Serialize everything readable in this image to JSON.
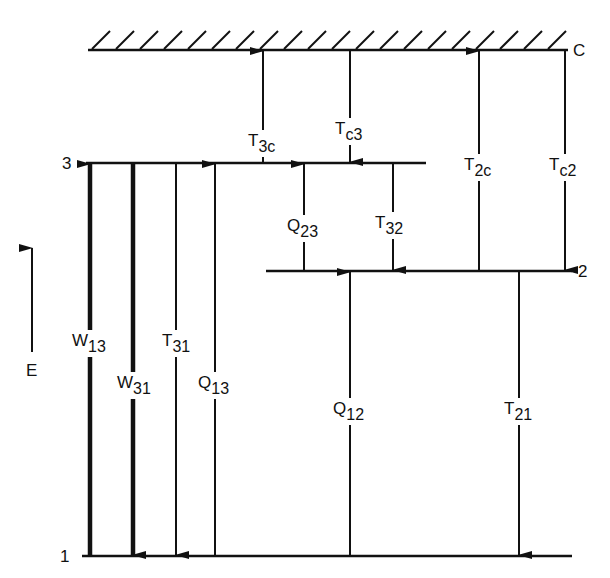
{
  "diagram": {
    "type": "energy-level-diagram",
    "axis": {
      "label": "E",
      "direction": "up"
    },
    "levels": [
      {
        "id": "C",
        "label": "C",
        "note": "continuum (hatched)"
      },
      {
        "id": "3",
        "label": "3"
      },
      {
        "id": "2",
        "label": "2"
      },
      {
        "id": "1",
        "label": "1"
      }
    ],
    "transitions": [
      {
        "name": "W",
        "sub": "13",
        "from": "1",
        "to": "3",
        "direction": "up",
        "weight": "thick"
      },
      {
        "name": "W",
        "sub": "31",
        "from": "3",
        "to": "1",
        "direction": "down",
        "weight": "thick"
      },
      {
        "name": "T",
        "sub": "31",
        "from": "3",
        "to": "1",
        "direction": "down",
        "weight": "thin"
      },
      {
        "name": "Q",
        "sub": "13",
        "from": "1",
        "to": "3",
        "direction": "up",
        "weight": "thin"
      },
      {
        "name": "T",
        "sub": "3c",
        "from": "3",
        "to": "C",
        "direction": "up",
        "weight": "thin"
      },
      {
        "name": "T",
        "sub": "c3",
        "from": "C",
        "to": "3",
        "direction": "down",
        "weight": "thin"
      },
      {
        "name": "Q",
        "sub": "23",
        "from": "2",
        "to": "3",
        "direction": "up",
        "weight": "thin"
      },
      {
        "name": "T",
        "sub": "32",
        "from": "3",
        "to": "2",
        "direction": "down",
        "weight": "thin"
      },
      {
        "name": "T",
        "sub": "2c",
        "from": "2",
        "to": "C",
        "direction": "up",
        "weight": "thin"
      },
      {
        "name": "T",
        "sub": "c2",
        "from": "C",
        "to": "2",
        "direction": "down",
        "weight": "thin"
      },
      {
        "name": "Q",
        "sub": "12",
        "from": "1",
        "to": "2",
        "direction": "up",
        "weight": "thin"
      },
      {
        "name": "T",
        "sub": "21",
        "from": "2",
        "to": "1",
        "direction": "down",
        "weight": "thin"
      }
    ]
  }
}
